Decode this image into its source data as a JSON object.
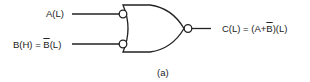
{
  "diagram": {
    "type": "logic-gate",
    "gate": "OR with inverted inputs and inverted output (NAND-equivalent form)",
    "inputs": [
      {
        "label_main": "A(L)",
        "bubble": true
      },
      {
        "label_prefix": "B(H) = ",
        "label_bar": "B",
        "label_suffix": "(L)",
        "bubble": true
      }
    ],
    "output": {
      "label_prefix": "C(L) = (A+",
      "label_bar": "B",
      "label_suffix": ")(L)",
      "bubble": true
    },
    "caption": "(a)",
    "stroke_color": "#222222"
  }
}
